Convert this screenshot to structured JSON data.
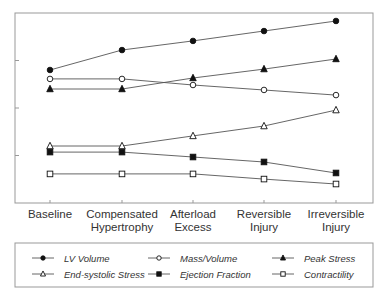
{
  "chart_data": {
    "type": "line",
    "title": "",
    "xlabel": "",
    "ylabel": "",
    "categories": [
      "Baseline",
      "Compensated Hypertrophy",
      "Afterload Excess",
      "Reversible Injury",
      "Irreversible Injury"
    ],
    "category_lines": [
      [
        "Baseline"
      ],
      [
        "Compensated",
        "Hypertrophy"
      ],
      [
        "Afterload",
        "Excess"
      ],
      [
        "Reversible",
        "Injury"
      ],
      [
        "Irreversible",
        "Injury"
      ]
    ],
    "ylim": [
      0,
      100
    ],
    "y_ticks": [
      25,
      50,
      75
    ],
    "y_tick_labels_shown": false,
    "grid": false,
    "legend_position": "bottom",
    "series": [
      {
        "name": "LV Volume",
        "marker": "filled-circle",
        "values": [
          70.0,
          80.5,
          85.3,
          90.5,
          95.8
        ]
      },
      {
        "name": "Mass/Volume",
        "marker": "open-circle",
        "values": [
          65.3,
          65.3,
          62.1,
          59.5,
          56.8
        ]
      },
      {
        "name": "Peak Stress",
        "marker": "filled-triangle",
        "values": [
          60.0,
          60.0,
          65.8,
          70.5,
          75.8
        ]
      },
      {
        "name": "End-systolic Stress",
        "marker": "open-triangle",
        "values": [
          30.0,
          30.0,
          35.3,
          40.5,
          48.9
        ]
      },
      {
        "name": "Ejection Fraction",
        "marker": "filled-square",
        "values": [
          26.8,
          26.8,
          24.2,
          21.6,
          15.8
        ]
      },
      {
        "name": "Contractility",
        "marker": "open-square",
        "values": [
          15.3,
          15.3,
          15.3,
          12.6,
          10.0
        ]
      }
    ]
  },
  "legend": {
    "items": [
      {
        "label": "LV Volume",
        "marker": "filled-circle"
      },
      {
        "label": "Mass/Volume",
        "marker": "open-circle"
      },
      {
        "label": "Peak Stress",
        "marker": "filled-triangle"
      },
      {
        "label": "End-systolic Stress",
        "marker": "open-triangle"
      },
      {
        "label": "Ejection Fraction",
        "marker": "filled-square"
      },
      {
        "label": "Contractility",
        "marker": "open-square"
      }
    ]
  },
  "colors": {
    "line": "#555555",
    "marker": "#111111",
    "frame": "#999999"
  }
}
